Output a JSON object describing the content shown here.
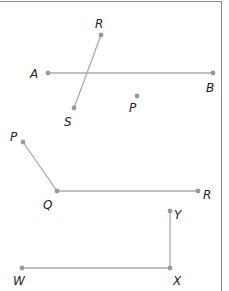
{
  "diagram": {
    "figures": [
      {
        "id": "fig1",
        "description": "Segments AB and RS intersecting, with point P",
        "points": [
          {
            "name": "R",
            "label": "R",
            "x": 101,
            "y": 35,
            "lx": 95,
            "ly": 28
          },
          {
            "name": "A",
            "label": "A",
            "x": 48,
            "y": 73,
            "lx": 30,
            "ly": 78
          },
          {
            "name": "B",
            "label": "B",
            "x": 213,
            "y": 73,
            "lx": 206,
            "ly": 92
          },
          {
            "name": "S",
            "label": "S",
            "x": 74,
            "y": 108,
            "lx": 64,
            "ly": 126
          },
          {
            "name": "P",
            "label": "P",
            "x": 137,
            "y": 96,
            "lx": 129,
            "ly": 112
          }
        ],
        "segments": [
          [
            "A",
            "B"
          ],
          [
            "R",
            "S"
          ]
        ]
      },
      {
        "id": "fig2",
        "description": "Angle PQR",
        "points": [
          {
            "name": "P",
            "label": "P",
            "x": 23,
            "y": 142,
            "lx": 10,
            "ly": 141
          },
          {
            "name": "Q",
            "label": "Q",
            "x": 57,
            "y": 191,
            "lx": 43,
            "ly": 209
          },
          {
            "name": "R",
            "label": "R",
            "x": 198,
            "y": 191,
            "lx": 203,
            "ly": 199
          }
        ],
        "segments": [
          [
            "P",
            "Q"
          ],
          [
            "Q",
            "R"
          ]
        ]
      },
      {
        "id": "fig3",
        "description": "Angle WXY",
        "points": [
          {
            "name": "Y",
            "label": "Y",
            "x": 170,
            "y": 211,
            "lx": 174,
            "ly": 219
          },
          {
            "name": "X",
            "label": "X",
            "x": 170,
            "y": 268,
            "lx": 173,
            "ly": 285
          },
          {
            "name": "W",
            "label": "W",
            "x": 22,
            "y": 268,
            "lx": 13,
            "ly": 285
          }
        ],
        "segments": [
          [
            "W",
            "X"
          ],
          [
            "X",
            "Y"
          ]
        ]
      }
    ],
    "colors": {
      "segment": "#aaaaaa",
      "point": "#999999",
      "label": "#222222",
      "frame": "#888888"
    }
  }
}
